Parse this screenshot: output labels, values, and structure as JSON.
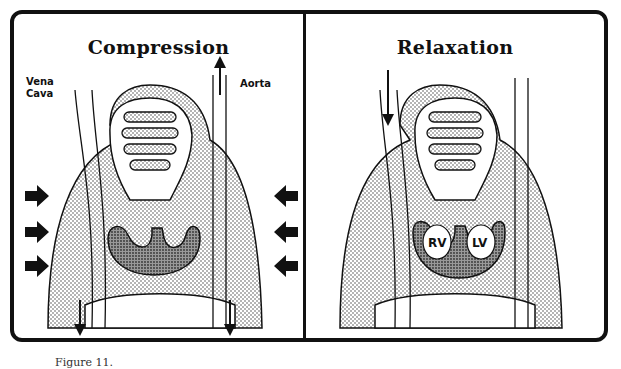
{
  "figure": {
    "caption_partial": "Figure 11.",
    "panels": [
      {
        "id": "compression",
        "title": "Compression",
        "labels": {
          "vena_cava": "Vena\nCava",
          "aorta": "Aorta"
        },
        "external_arrows": {
          "left": 3,
          "right": 3,
          "direction": "inward"
        }
      },
      {
        "id": "relaxation",
        "title": "Relaxation",
        "chamber_labels": {
          "right_ventricle": "RV",
          "left_ventricle": "LV"
        }
      }
    ]
  },
  "colors": {
    "ink": "#111111",
    "stipple": "#bdbdbd",
    "heart": "#7a7a7a",
    "background": "#ffffff"
  }
}
